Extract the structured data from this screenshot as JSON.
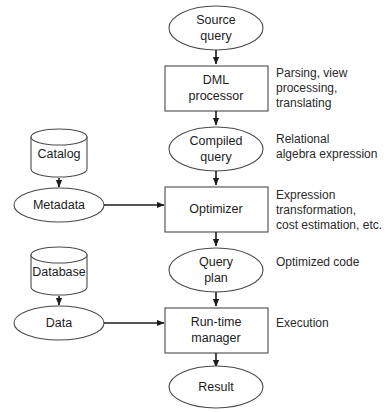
{
  "diagram": {
    "background_color": "#ffffff",
    "shape_stroke_color": "#4a4a4a",
    "arrow_color": "#1c1c1c",
    "text_color": "#1c1c1c"
  },
  "nodes": {
    "source_query": {
      "label_line1": "Source",
      "label_line2": "query",
      "shape": "ellipse"
    },
    "dml_processor": {
      "label_line1": "DML",
      "label_line2": "processor",
      "shape": "rectangle"
    },
    "compiled_query": {
      "label_line1": "Compiled",
      "label_line2": "query",
      "shape": "ellipse"
    },
    "optimizer": {
      "label_line1": "Optimizer",
      "label_line2": "",
      "shape": "rectangle"
    },
    "query_plan": {
      "label_line1": "Query",
      "label_line2": "plan",
      "shape": "ellipse"
    },
    "runtime_manager": {
      "label_line1": "Run-time",
      "label_line2": "manager",
      "shape": "rectangle"
    },
    "result": {
      "label_line1": "Result",
      "label_line2": "",
      "shape": "ellipse"
    },
    "catalog": {
      "label": "Catalog",
      "shape": "cylinder"
    },
    "metadata": {
      "label": "Metadata",
      "shape": "ellipse"
    },
    "database": {
      "label": "Database",
      "shape": "cylinder"
    },
    "data": {
      "label": "Data",
      "shape": "ellipse"
    }
  },
  "annotations": {
    "dml_processor": {
      "line1": "Parsing, view",
      "line2": "processing,",
      "line3": "translating"
    },
    "compiled_query": {
      "line1": "Relational",
      "line2": "algebra expression",
      "line3": ""
    },
    "optimizer": {
      "line1": "Expression",
      "line2": "transformation,",
      "line3": "cost estimation, etc."
    },
    "query_plan": {
      "line1": "Optimized code",
      "line2": "",
      "line3": ""
    },
    "runtime_manager": {
      "line1": "Execution",
      "line2": "",
      "line3": ""
    }
  },
  "edges": [
    {
      "from": "source_query",
      "to": "dml_processor",
      "kind": "arrow-down"
    },
    {
      "from": "dml_processor",
      "to": "compiled_query",
      "kind": "arrow-down"
    },
    {
      "from": "compiled_query",
      "to": "optimizer",
      "kind": "arrow-down"
    },
    {
      "from": "optimizer",
      "to": "query_plan",
      "kind": "arrow-down"
    },
    {
      "from": "query_plan",
      "to": "runtime_manager",
      "kind": "arrow-down"
    },
    {
      "from": "runtime_manager",
      "to": "result",
      "kind": "arrow-down"
    },
    {
      "from": "catalog",
      "to": "metadata",
      "kind": "arrow-down"
    },
    {
      "from": "metadata",
      "to": "optimizer",
      "kind": "arrow-right"
    },
    {
      "from": "database",
      "to": "data",
      "kind": "arrow-down"
    },
    {
      "from": "data",
      "to": "runtime_manager",
      "kind": "arrow-right"
    }
  ]
}
